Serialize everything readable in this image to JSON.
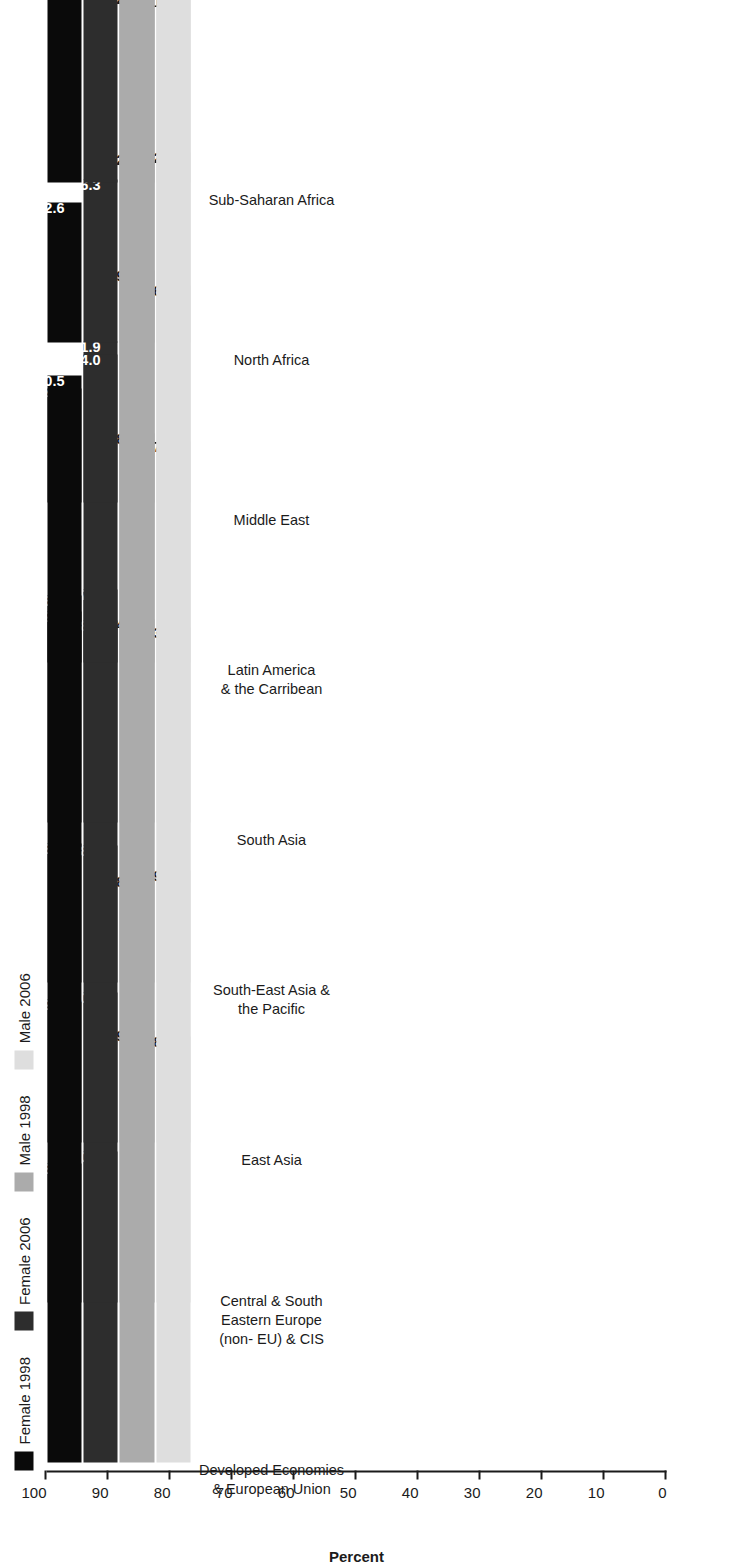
{
  "chart_data": {
    "type": "bar",
    "orientation": "vertical-rotated",
    "title": "",
    "xlabel": "",
    "ylabel": "Percent",
    "ylim": [
      0,
      100
    ],
    "ytick_labels": [
      "0",
      "10",
      "20",
      "30",
      "40",
      "50",
      "60",
      "70",
      "80",
      "90",
      "100"
    ],
    "yticks": [
      0,
      10,
      20,
      30,
      40,
      50,
      60,
      70,
      80,
      90,
      100
    ],
    "grid": false,
    "legend_position": "top-left",
    "categories": [
      "Developed Economies\n& European Union",
      "Central & South\nEastern Europe\n(non- EU) & CIS",
      "East Asia",
      "South-East Asia &\nthe Pacific",
      "South Asia",
      "Latin America\n& the Carribean",
      "Middle East",
      "North Africa",
      "Sub-Saharan Africa"
    ],
    "series": [
      {
        "name": "Female 1998",
        "color": "#0a0a0a",
        "label_color": "#ffffff",
        "values": [
          48.3,
          49.0,
          48.3,
          59.9,
          36.7,
          44.2,
          20.5,
          22.6,
          60.8
        ],
        "value_labels": [
          "48.3",
          "49.0",
          "48.3",
          "59.9",
          "36.7",
          "44.2",
          "20.5",
          "22.6",
          "60.8"
        ]
      },
      {
        "name": "Female 2006",
        "color": "#2d2d2d",
        "label_color": "#ffffff",
        "values": [
          50.3,
          50.0,
          48.0,
          58.4,
          37.7,
          51.9,
          24.0,
          26.3,
          62.2
        ],
        "value_labels": [
          "50.3",
          "50.0",
          "48.0",
          "58.4",
          "37.7",
          "51.9",
          "24.0",
          "26.3",
          "62.2"
        ]
      },
      {
        "name": "Male 1998",
        "color": "#ababab",
        "label_color": "#1a1a1a",
        "values": [
          69.8,
          68.7,
          84.4,
          88.6,
          89.1,
          82.0,
          82.2,
          81.0,
          86.2
        ],
        "value_labels": [
          "69.8",
          "68.7",
          "84.4",
          "88.6",
          "89.1",
          "82.0",
          "82.2",
          "81.0",
          "86.2"
        ]
      },
      {
        "name": "Male 2006",
        "color": "#dedede",
        "label_color": "#1a1a1a",
        "values": [
          68.7,
          69.7,
          83.2,
          87.4,
          86.7,
          82.3,
          81.6,
          81.7,
          85.3
        ],
        "value_labels": [
          "68.7",
          "69.7",
          "83.2",
          "87.4",
          "86.7",
          "82.3",
          "81.6",
          "81.7",
          "85.3"
        ]
      }
    ]
  },
  "legend": {
    "items": [
      {
        "label": "Female 1998",
        "color": "#0a0a0a"
      },
      {
        "label": "Female 2006",
        "color": "#2d2d2d"
      },
      {
        "label": "Male 1998",
        "color": "#ababab"
      },
      {
        "label": "Male 2006",
        "color": "#dedede"
      }
    ]
  },
  "axis": {
    "title": "Percent"
  }
}
